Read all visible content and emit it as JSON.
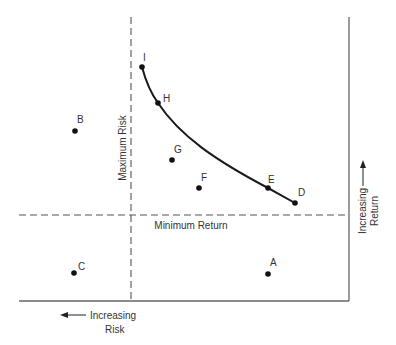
{
  "diagram": {
    "type": "risk-return-quadrant",
    "labels": {
      "max_risk": "Maximum Risk",
      "min_return": "Minimum Return",
      "x_axis_line1": "Increasing",
      "x_axis_line2": "Risk",
      "y_axis_line1": "Increasing",
      "y_axis_line2": "Return"
    },
    "points": [
      {
        "id": "A",
        "label": "A"
      },
      {
        "id": "B",
        "label": "B"
      },
      {
        "id": "C",
        "label": "C"
      },
      {
        "id": "D",
        "label": "D"
      },
      {
        "id": "E",
        "label": "E"
      },
      {
        "id": "F",
        "label": "F"
      },
      {
        "id": "G",
        "label": "G"
      },
      {
        "id": "H",
        "label": "H"
      },
      {
        "id": "I",
        "label": "I"
      }
    ],
    "frontier": [
      "I",
      "H",
      "E",
      "D"
    ],
    "colors": {
      "line": "#555555",
      "curve": "#1a1a1a",
      "dot": "#111111"
    }
  }
}
